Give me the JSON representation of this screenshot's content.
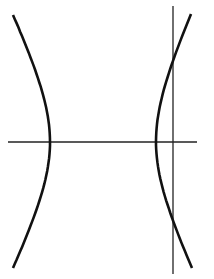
{
  "diagram": {
    "type": "hyperbola-with-lines",
    "background": "#ffffff",
    "stroke_color": "#111111",
    "horizontal_line": {
      "x1": 8,
      "y1": 142,
      "x2": 197,
      "y2": 142
    },
    "vertical_line": {
      "x1": 173,
      "y1": 6,
      "x2": 173,
      "y2": 274
    },
    "left_branch": {
      "top": [
        13,
        15
      ],
      "vertex": [
        50,
        142
      ],
      "bottom": [
        13,
        268
      ]
    },
    "right_branch": {
      "top": [
        191,
        14
      ],
      "vertex": [
        156,
        142
      ],
      "bottom": [
        192,
        268
      ]
    }
  }
}
